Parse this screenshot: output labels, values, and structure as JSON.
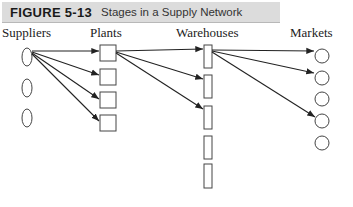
{
  "figure": {
    "number": "FIGURE 5-13",
    "title": "Stages in a Supply Network"
  },
  "columns": [
    {
      "label": "Suppliers",
      "count": 3,
      "shape": "ellipse"
    },
    {
      "label": "Plants",
      "count": 4,
      "shape": "square"
    },
    {
      "label": "Warehouses",
      "count": 5,
      "shape": "tall-rectangle"
    },
    {
      "label": "Markets",
      "count": 5,
      "shape": "circle"
    }
  ],
  "edges": [
    {
      "from": "Suppliers.0",
      "to": "Plants.0"
    },
    {
      "from": "Suppliers.0",
      "to": "Plants.1"
    },
    {
      "from": "Suppliers.0",
      "to": "Plants.2"
    },
    {
      "from": "Suppliers.0",
      "to": "Plants.3"
    },
    {
      "from": "Plants.0",
      "to": "Warehouses.0"
    },
    {
      "from": "Plants.0",
      "to": "Warehouses.1"
    },
    {
      "from": "Plants.0",
      "to": "Warehouses.2"
    },
    {
      "from": "Warehouses.0",
      "to": "Markets.0"
    },
    {
      "from": "Warehouses.0",
      "to": "Markets.1"
    },
    {
      "from": "Warehouses.0",
      "to": "Markets.3"
    }
  ],
  "colors": {
    "header_bg": "#dcdcdc",
    "stroke": "#444444",
    "arrow": "#222222"
  }
}
